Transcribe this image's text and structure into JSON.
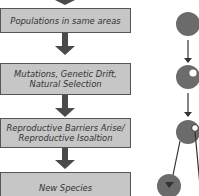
{
  "flowchart": {
    "steps": [
      {
        "label": "Populations in same areas"
      },
      {
        "label": "Mutations, Genetic Drift, Natural Selection",
        "line1": "Mutations, Genetic Drift,",
        "line2": "Natural Selection"
      },
      {
        "label": "Reproductive Barriers Arise/ Reproductive Isoaltion",
        "line1": "Reproductive Barriers Arise/",
        "line2": "Reproductive Isoaltion"
      },
      {
        "label": "New Species"
      }
    ]
  },
  "illustration": {
    "description": "Sympatric speciation schematic: population circle, mutant appears, splits into two species",
    "colors": {
      "population": "#6b6b6b",
      "mutant": "#ffffff",
      "arrow": "#333333",
      "box_fill": "#c6c6c6"
    }
  }
}
